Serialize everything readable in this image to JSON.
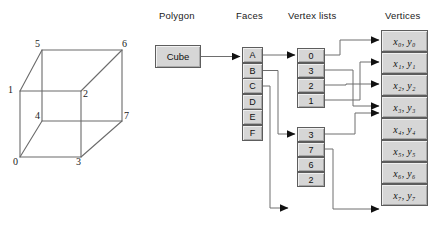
{
  "diagram": {
    "title_columns": {
      "polygon": "Polygon",
      "faces": "Faces",
      "vertex_lists": "Vertex lists",
      "vertices": "Vertices"
    },
    "polygon_node": {
      "label": "Cube"
    },
    "faces": [
      {
        "label": "A"
      },
      {
        "label": "B"
      },
      {
        "label": "C"
      },
      {
        "label": "D"
      },
      {
        "label": "E"
      },
      {
        "label": "F"
      }
    ],
    "vertex_lists": [
      {
        "name": "list-a",
        "cells": [
          "0",
          "3",
          "2",
          "1"
        ]
      },
      {
        "name": "list-b",
        "cells": [
          "3",
          "7",
          "6",
          "2"
        ]
      }
    ],
    "vertices": [
      {
        "label": "x₀, y₀"
      },
      {
        "label": "x₁, y₁"
      },
      {
        "label": "x₂, y₂"
      },
      {
        "label": "x₃, y₃"
      },
      {
        "label": "x₄, y₄"
      },
      {
        "label": "x₅, y₅"
      },
      {
        "label": "x₆, y₆"
      },
      {
        "label": "x₇, y₇"
      }
    ],
    "cube": {
      "vertex_labels": [
        "0",
        "1",
        "2",
        "3",
        "4",
        "5",
        "6",
        "7"
      ]
    },
    "colors": {
      "box_fill": "#d6d6d6",
      "box_border": "#5d5d5d",
      "connector": "#6e6e6e",
      "arrow": "#111111",
      "cube_line": "#6b6b6b",
      "text": "#111111",
      "background": "#ffffff"
    }
  }
}
